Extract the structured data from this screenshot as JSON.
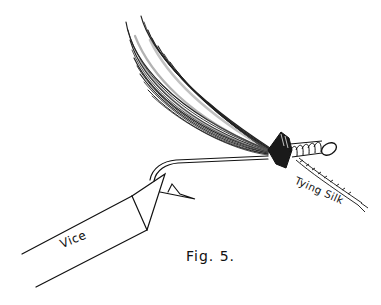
{
  "figure": {
    "caption": "Fig. 5."
  },
  "labels": {
    "vice": "Vice",
    "tying_silk": "Tying Silk"
  },
  "colors": {
    "ink": "#111111",
    "paper": "#ffffff",
    "wing_mid": "#555555"
  }
}
